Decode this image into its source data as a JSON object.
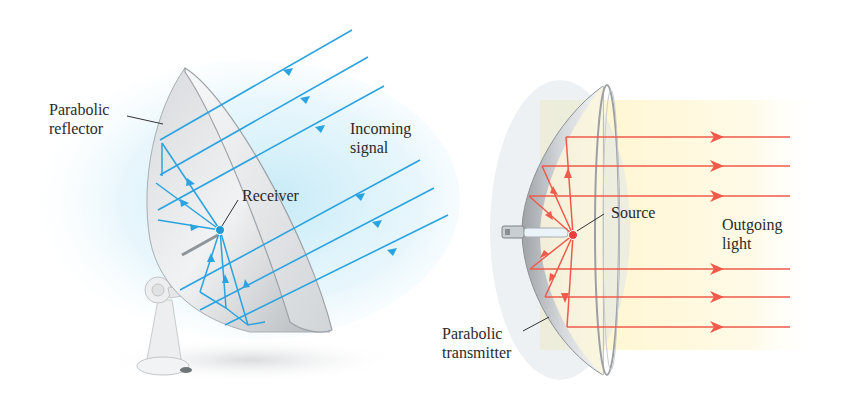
{
  "colors": {
    "signal_ray": "#2aa3e0",
    "light_ray": "#ef5a4a",
    "dish_fill": "#e6e8ea",
    "dish_shadow": "#b9bdc1",
    "glow_blue": "#bfe8f6",
    "glow_yellow": "#fff4c4",
    "receiver_dot": "#1f9ad6",
    "source_dot": "#e8403a",
    "label_text": "#2a2a2a"
  },
  "left_diagram": {
    "name": "Parabolic reflector (satellite dish)",
    "labels": {
      "reflector": "Parabolic\nreflector",
      "signal": "Incoming\nsignal",
      "receiver": "Receiver"
    },
    "incoming_ray_count": 6,
    "ray_direction": "toward dish, down-left"
  },
  "right_diagram": {
    "name": "Parabolic transmitter (headlight)",
    "labels": {
      "transmitter": "Parabolic\ntransmitter",
      "source": "Source",
      "light": "Outgoing\nlight"
    },
    "outgoing_ray_count": 6,
    "ray_direction": "horizontal, rightward"
  }
}
